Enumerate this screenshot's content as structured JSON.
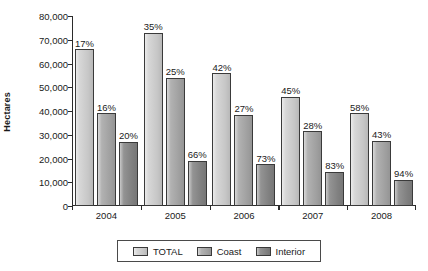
{
  "chart_data": {
    "type": "bar",
    "title": "",
    "xlabel": "",
    "ylabel": "Hectares",
    "ylim": [
      0,
      80000
    ],
    "yticks": [
      0,
      10000,
      20000,
      30000,
      40000,
      50000,
      60000,
      70000,
      80000
    ],
    "ytick_labels": [
      "0",
      "10,000",
      "20,000",
      "30,000",
      "40,000",
      "50,000",
      "60,000",
      "70,000",
      "80,000"
    ],
    "grid": false,
    "legend_position": "bottom",
    "categories": [
      "2004",
      "2005",
      "2006",
      "2007",
      "2008"
    ],
    "series": [
      {
        "name": "TOTAL",
        "color": "#d2d2d2",
        "values": [
          66000,
          73000,
          56000,
          46000,
          39000
        ],
        "point_labels": [
          "17%",
          "35%",
          "42%",
          "45%",
          "58%"
        ]
      },
      {
        "name": "Coast",
        "color": "#a9a9a9",
        "values": [
          39000,
          54000,
          38500,
          31500,
          27500
        ],
        "point_labels": [
          "16%",
          "25%",
          "27%",
          "28%",
          "43%"
        ]
      },
      {
        "name": "Interior",
        "color": "#878787",
        "values": [
          27000,
          19000,
          17500,
          14500,
          11000
        ],
        "point_labels": [
          "20%",
          "66%",
          "73%",
          "83%",
          "94%"
        ]
      }
    ]
  },
  "axis": {
    "y_title": "Hectares"
  },
  "legend": {
    "items": [
      {
        "label": "TOTAL",
        "swatch": "total"
      },
      {
        "label": "Coast",
        "swatch": "coast"
      },
      {
        "label": "Interior",
        "swatch": "interior"
      }
    ]
  }
}
